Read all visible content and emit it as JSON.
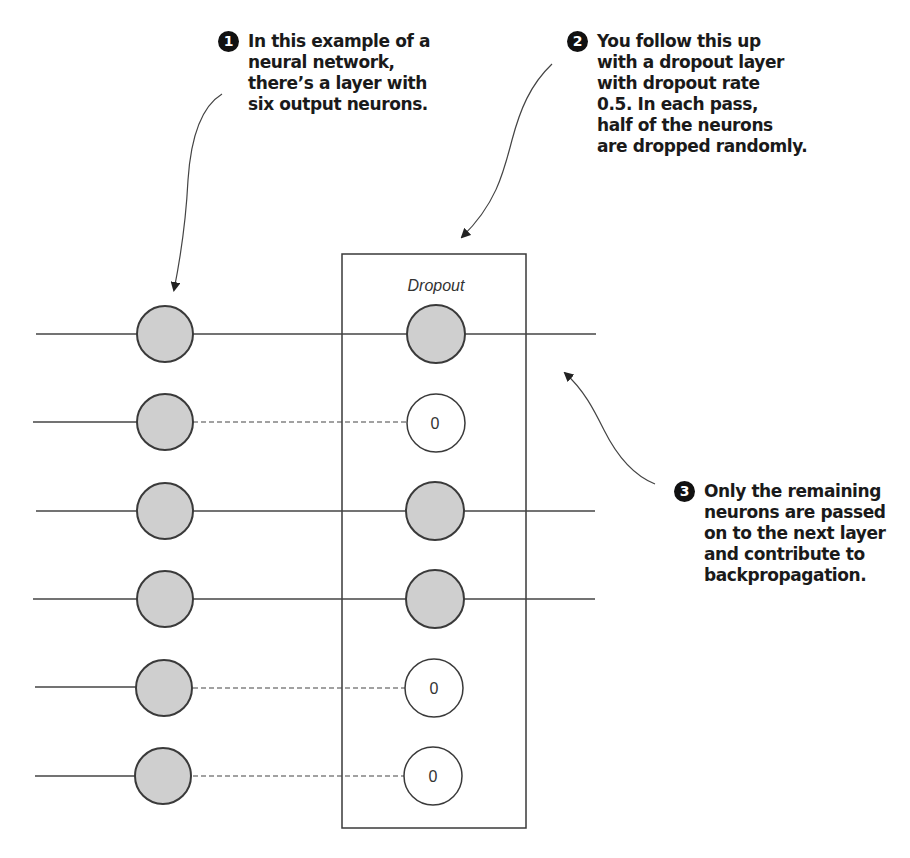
{
  "diagram": {
    "layer_label": "Dropout",
    "dropped_value": "0",
    "dropout_rate": 0.5,
    "input_neuron_count": 6,
    "neurons": [
      {
        "index": 1,
        "dropped": false
      },
      {
        "index": 2,
        "dropped": true
      },
      {
        "index": 3,
        "dropped": false
      },
      {
        "index": 4,
        "dropped": false
      },
      {
        "index": 5,
        "dropped": true
      },
      {
        "index": 6,
        "dropped": true
      }
    ],
    "colors": {
      "neuron_fill": "#cfcfcf",
      "stroke": "#3a3a3a",
      "dropped_fill": "#ffffff",
      "badge": "#111111"
    }
  },
  "annotations": [
    {
      "number": "1",
      "lines": [
        "In this example of a",
        "neural network,",
        "there’s a layer with",
        "six output neurons."
      ]
    },
    {
      "number": "2",
      "lines": [
        "You follow this up",
        "with a dropout layer",
        "with dropout rate",
        "0.5. In each pass,",
        "half of the neurons",
        "are dropped randomly."
      ]
    },
    {
      "number": "3",
      "lines": [
        "Only the remaining",
        "neurons are passed",
        "on to the next layer",
        "and contribute to",
        "backpropagation."
      ]
    }
  ]
}
